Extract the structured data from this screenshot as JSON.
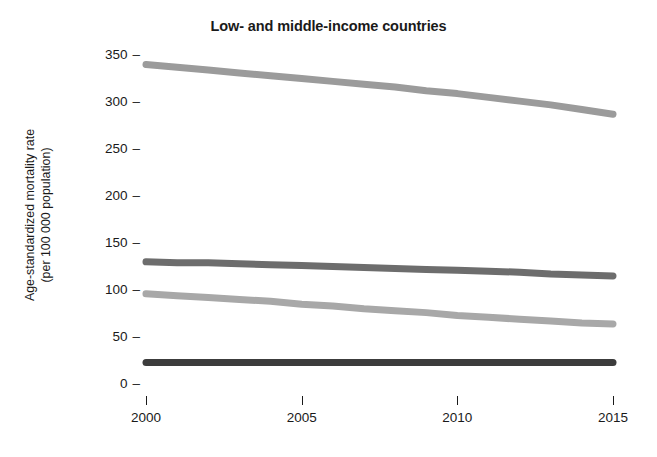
{
  "chart_data": {
    "type": "line",
    "title": "Low- and middle-income countries",
    "xlabel": "",
    "ylabel": "Age-standardized mortality rate (per 100 000 population)",
    "ylabel_line1": "Age-standardized mortality rate",
    "ylabel_line2": "(per 100 000 population)",
    "x": [
      2000,
      2001,
      2002,
      2003,
      2004,
      2005,
      2006,
      2007,
      2008,
      2009,
      2010,
      2011,
      2012,
      2013,
      2014,
      2015
    ],
    "xlim": [
      2000,
      2015
    ],
    "ylim": [
      0,
      360
    ],
    "xticks": [
      2000,
      2005,
      2010,
      2015
    ],
    "xtick_labels": [
      "2000",
      "2005",
      "2010",
      "2015"
    ],
    "yticks": [
      0,
      50,
      100,
      150,
      200,
      250,
      300,
      350
    ],
    "ytick_labels": [
      "0",
      "50",
      "100",
      "150",
      "200",
      "250",
      "300",
      "350"
    ],
    "grid": false,
    "legend": "none",
    "series": [
      {
        "name": "series-1",
        "color": "#9b9b9b",
        "values": [
          341,
          338,
          335,
          332,
          329,
          326,
          323,
          320,
          317,
          313,
          310,
          306,
          302,
          298,
          293,
          288
        ]
      },
      {
        "name": "series-2",
        "color": "#6d6d6d",
        "values": [
          131,
          130,
          130,
          129,
          128,
          127,
          126,
          125,
          124,
          123,
          122,
          121,
          120,
          118,
          117,
          116
        ]
      },
      {
        "name": "series-3",
        "color": "#a8a8a8",
        "values": [
          97,
          95,
          93,
          91,
          89,
          86,
          84,
          81,
          79,
          77,
          74,
          72,
          70,
          68,
          66,
          65
        ]
      },
      {
        "name": "series-4",
        "color": "#3c3c3c",
        "values": [
          24,
          24,
          24,
          24,
          24,
          24,
          24,
          24,
          24,
          24,
          24,
          24,
          24,
          24,
          24,
          24
        ]
      }
    ]
  }
}
